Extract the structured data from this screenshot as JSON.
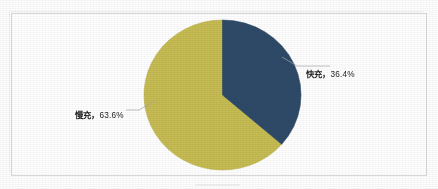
{
  "figure": {
    "background_color": "#ffffff",
    "frame_color": "#d9d9d9",
    "label_text_color": "#1d1d1d",
    "leader_line_color": "#a6a6a6"
  },
  "chart_data": {
    "type": "pie",
    "title": "",
    "subtitle": "",
    "xlabel": "",
    "ylabel": "",
    "legend_position": "none",
    "grid": false,
    "labels_shown_as": "category, percentage",
    "start_angle_deg": 0,
    "direction": "clockwise",
    "categories": [
      "快充",
      "慢充"
    ],
    "values": [
      36.4,
      63.6
    ],
    "unit": "%",
    "slices": [
      {
        "name": "快充",
        "percent": 36.4,
        "percent_label": "36.4%",
        "label": "快充，36.4%",
        "color": "#2e4a68",
        "start_angle_deg": 0,
        "end_angle_deg": 131.04
      },
      {
        "name": "慢充",
        "percent": 63.6,
        "percent_label": "63.6%",
        "label": "慢充，63.6%",
        "color": "#c6bc53",
        "start_angle_deg": 131.04,
        "end_angle_deg": 360
      }
    ],
    "annotations": [
      {
        "name": "快充",
        "text": "快充，36.4%",
        "cjk": "快充，",
        "number": "36.4%",
        "position": "right"
      },
      {
        "name": "慢充",
        "text": "慢充，63.6%",
        "cjk": "慢充，",
        "number": "63.6%",
        "position": "left"
      }
    ]
  }
}
